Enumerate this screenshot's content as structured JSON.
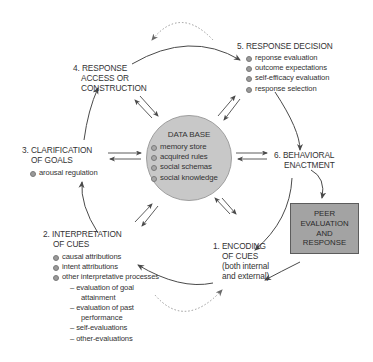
{
  "diagram": {
    "type": "social information processing cycle",
    "colors": {
      "database_fill": "#c8c8c8",
      "peer_box_fill": "#a3a3a3",
      "line": "#4a4a4a",
      "dotted": "#9a9a9a",
      "text": "#333333"
    },
    "steps": [
      {
        "id": "encoding",
        "title_line1": "1. ENCODING",
        "title_line2": "OF CUES",
        "sub_line1": "(both internal",
        "sub_line2": "and external)"
      },
      {
        "id": "interpretation",
        "title_line1": "2. INTERPRETATION",
        "title_line2": "OF CUES",
        "bullets": [
          "causal attributions",
          "intent attributions",
          "other interpretative processes"
        ],
        "sub_items": [
          {
            "line1": "– evaluation of goal",
            "line2": "attainment"
          },
          {
            "line1": "– evaluation of past",
            "line2": "performance"
          },
          {
            "line1": "– self-evaluations"
          },
          {
            "line1": "– other-evaluations"
          }
        ]
      },
      {
        "id": "clarification",
        "title_line1": "3. CLARIFICATION",
        "title_line2": "OF GOALS",
        "bullets": [
          "arousal regulation"
        ]
      },
      {
        "id": "response-access",
        "title_line1": "4. RESPONSE",
        "title_line2": "ACCESS OR",
        "title_line3": "CONSTRUCTION"
      },
      {
        "id": "response-decision",
        "title_line1": "5. RESPONSE DECISION",
        "bullets": [
          "reponse evaluation",
          "outcome expectations",
          "self-efficacy evaluation",
          "response selection"
        ]
      },
      {
        "id": "behavioral-enactment",
        "title_line1": "6. BEHAVIORAL",
        "title_line2": "ENACTMENT"
      }
    ],
    "database": {
      "title": "DATA BASE",
      "items": [
        "memory store",
        "acquired rules",
        "social schemas",
        "social knowledge"
      ]
    },
    "peer_box": {
      "label": "PEER\nEVALUATION\nAND\nRESPONSE"
    }
  }
}
